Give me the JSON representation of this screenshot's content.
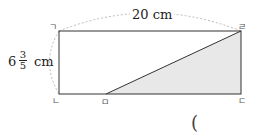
{
  "diagram": {
    "width_label": "20 cm",
    "height_label": {
      "whole": "6",
      "numerator": "3",
      "denominator": "5",
      "unit": "cm"
    },
    "vertices": {
      "top_left": "ㄱ",
      "bottom_left": "ㄴ",
      "bottom_right": "ㄷ",
      "top_right": "ㄹ",
      "bottom_point": "ㅁ"
    },
    "shaded_region": "triangle ㅁㄷㄹ",
    "colors": {
      "stroke": "#333333",
      "shade": "#e8e8e8",
      "dashed_arc": "#bbbbbb"
    }
  },
  "answer": {
    "open_paren": "("
  }
}
